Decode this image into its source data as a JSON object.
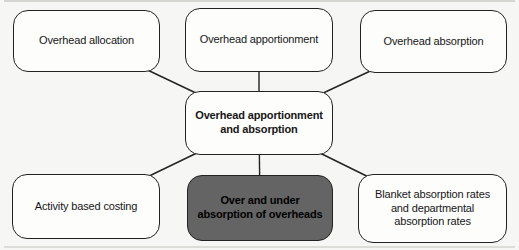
{
  "diagram": {
    "topic": "Overhead apportionment and absorption",
    "colors": {
      "background": "#f6f6f4",
      "node_fill": "#fdfdfc",
      "node_border": "#222222",
      "edge_line": "#222222",
      "highlight_fill": "#646464",
      "highlight_text": "#000000"
    },
    "nodes": [
      {
        "id": "overhead-allocation",
        "label": "Overhead allocation"
      },
      {
        "id": "overhead-apportionment",
        "label": "Overhead apportionment"
      },
      {
        "id": "overhead-absorption",
        "label": "Overhead absorption"
      },
      {
        "id": "center",
        "label": "Overhead apportionment\nand absorption",
        "emphasis": "bold"
      },
      {
        "id": "activity-based-costing",
        "label": "Activity based costing"
      },
      {
        "id": "over-under-absorption",
        "label": "Over and under\nabsorption of overheads",
        "emphasis": "bold",
        "style": "highlight"
      },
      {
        "id": "blanket-absorption-rates",
        "label": "Blanket absorption rates\nand departmental\nabsorption rates"
      }
    ],
    "edges": [
      {
        "from": "center",
        "to": "overhead-allocation"
      },
      {
        "from": "center",
        "to": "overhead-apportionment"
      },
      {
        "from": "center",
        "to": "overhead-absorption"
      },
      {
        "from": "center",
        "to": "activity-based-costing"
      },
      {
        "from": "center",
        "to": "over-under-absorption"
      },
      {
        "from": "center",
        "to": "blanket-absorption-rates"
      }
    ]
  }
}
